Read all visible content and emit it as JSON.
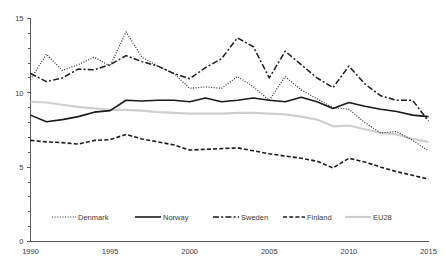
{
  "chart_data": {
    "type": "line",
    "title": "",
    "subtitle": "",
    "xlabel": "",
    "ylabel": "",
    "xlim": [
      1990,
      2015
    ],
    "ylim": [
      0,
      15
    ],
    "grid": false,
    "legend_position": "bottom",
    "x": [
      1990,
      1991,
      1992,
      1993,
      1994,
      1995,
      1996,
      1997,
      1998,
      1999,
      2000,
      2001,
      2002,
      2003,
      2004,
      2005,
      2006,
      2007,
      2008,
      2009,
      2010,
      2011,
      2012,
      2013,
      2014,
      2015
    ],
    "xticks": [
      1990,
      1995,
      2000,
      2005,
      2010,
      2015
    ],
    "xtick_labels": [
      "1990",
      "1995",
      "2000",
      "2005",
      "2010",
      "2015"
    ],
    "yticks": [
      0,
      5,
      10,
      15
    ],
    "ytick_labels": [
      "0",
      "5",
      "10",
      "15"
    ],
    "yminor_step": 1,
    "series": [
      {
        "name": "Denmark",
        "style": "dotted",
        "color": "#262626",
        "width": 1.2,
        "dasharray": "1,1.6",
        "values": [
          10.9,
          12.6,
          11.5,
          11.9,
          12.4,
          11.8,
          14.1,
          12.4,
          11.8,
          11.3,
          10.3,
          10.4,
          10.3,
          11.1,
          10.4,
          9.5,
          11.1,
          10.2,
          9.6,
          9.0,
          8.9,
          8.0,
          7.3,
          7.4,
          6.8,
          6.1
        ]
      },
      {
        "name": "Norway",
        "style": "solid",
        "color": "#1a1a1a",
        "width": 1.6,
        "dasharray": "none",
        "values": [
          8.5,
          8.05,
          8.2,
          8.4,
          8.7,
          8.8,
          9.5,
          9.45,
          9.5,
          9.5,
          9.4,
          9.65,
          9.4,
          9.5,
          9.65,
          9.5,
          9.4,
          9.7,
          9.4,
          8.95,
          9.35,
          9.1,
          8.9,
          8.75,
          8.5,
          8.4
        ]
      },
      {
        "name": "Sweden",
        "style": "dash-dot",
        "color": "#1a1a1a",
        "width": 1.5,
        "dasharray": "6,2.2,2,2.2",
        "values": [
          11.3,
          10.75,
          11.0,
          11.6,
          11.55,
          11.9,
          12.5,
          12.1,
          11.8,
          11.3,
          10.95,
          11.7,
          12.3,
          13.7,
          13.1,
          11.0,
          12.8,
          11.9,
          11.0,
          10.35,
          11.8,
          10.6,
          9.8,
          9.5,
          9.5,
          8.1
        ]
      },
      {
        "name": "Finland",
        "style": "dashed",
        "color": "#1a1a1a",
        "width": 1.6,
        "dasharray": "4,2.2",
        "values": [
          6.8,
          6.7,
          6.65,
          6.55,
          6.8,
          6.85,
          7.2,
          6.9,
          6.7,
          6.5,
          6.15,
          6.2,
          6.25,
          6.3,
          6.1,
          5.9,
          5.75,
          5.6,
          5.4,
          4.95,
          5.6,
          5.35,
          5.0,
          4.7,
          4.45,
          4.2
        ]
      },
      {
        "name": "EU28",
        "style": "solid",
        "color": "#cfcfcf",
        "width": 2.2,
        "dasharray": "none",
        "values": [
          9.4,
          9.35,
          9.2,
          9.05,
          8.95,
          8.85,
          8.85,
          8.8,
          8.7,
          8.65,
          8.6,
          8.6,
          8.6,
          8.65,
          8.65,
          8.6,
          8.55,
          8.4,
          8.2,
          7.75,
          7.8,
          7.55,
          7.3,
          7.2,
          6.9,
          6.7
        ]
      }
    ]
  },
  "legend": {
    "items": [
      {
        "label": "Denmark"
      },
      {
        "label": "Norway"
      },
      {
        "label": "Sweden"
      },
      {
        "label": "Finland"
      },
      {
        "label": "EU28"
      }
    ]
  }
}
